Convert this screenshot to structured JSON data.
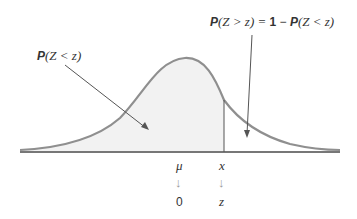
{
  "labels": {
    "left_prob": {
      "P": "P",
      "expr": "(Z < z)"
    },
    "right_prob": {
      "P1": "P",
      "expr1": "(Z > z) = ",
      "one": "1",
      "minus": " − ",
      "P2": "P",
      "expr2": "(Z < z)"
    },
    "mu": "μ",
    "x": "x",
    "zero": "0",
    "z": "z",
    "down_arrow": "↓"
  },
  "colors": {
    "curve": "#8f8f8f",
    "fill": "#f2f2f2",
    "axis": "#4a4a4a",
    "pointer": "#555555",
    "arrow_gray": "#9a9a9a"
  }
}
